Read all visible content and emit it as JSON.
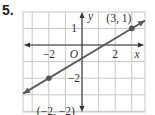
{
  "problem_number": "5.",
  "chart_data": {
    "type": "line",
    "title": "",
    "xlabel": "x",
    "ylabel": "y",
    "origin_label": "O",
    "xlim": [
      -3.6,
      3.8
    ],
    "ylim": [
      -4,
      2
    ],
    "x_ticks": [
      {
        "value": -2,
        "label": "−2"
      },
      {
        "value": 2,
        "label": "2"
      }
    ],
    "y_ticks": [
      {
        "value": 1,
        "label": "1"
      },
      {
        "value": -2,
        "label": "−2"
      }
    ],
    "grid": true,
    "series": [
      {
        "name": "line through (-2,-2) and (3,1)",
        "x": [
          -2,
          3
        ],
        "y": [
          -2,
          1
        ],
        "slope": 0.6,
        "arrows": "both"
      }
    ],
    "points": [
      {
        "x": -2,
        "y": -2,
        "label": "(−2, −2)"
      },
      {
        "x": 3,
        "y": 1,
        "label": "(3, 1)"
      }
    ],
    "colors": {
      "line": "#5a5a5a",
      "grid": "#c8c8c8",
      "axis": "#333333",
      "point": "#555555"
    }
  }
}
